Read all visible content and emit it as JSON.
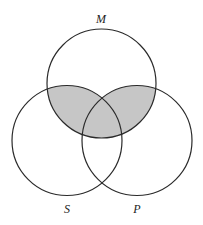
{
  "diagram": {
    "type": "venn",
    "sets": [
      {
        "id": "M",
        "label": "M",
        "cx": 101.5,
        "cy": 83.5,
        "r": 54.5
      },
      {
        "id": "S",
        "label": "S",
        "cx": 67,
        "cy": 140.5,
        "r": 55
      },
      {
        "id": "P",
        "label": "P",
        "cx": 137,
        "cy": 140.5,
        "r": 55
      }
    ],
    "shaded_region": "M ∩ (S ∪ P)",
    "shade_color": "#c6c6c6",
    "stroke_color": "#2a2a2a",
    "labels": {
      "M": {
        "text": "M",
        "x": 101,
        "y": 23
      },
      "S": {
        "text": "S",
        "x": 67,
        "y": 213
      },
      "P": {
        "text": "P",
        "x": 137,
        "y": 213
      }
    }
  }
}
